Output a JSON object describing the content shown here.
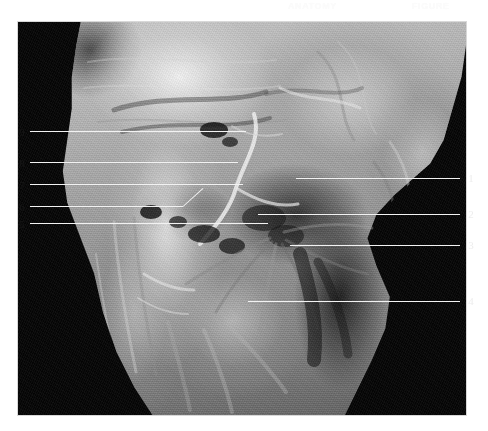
{
  "figure": {
    "kind": "anatomical-dissection-photograph",
    "region_description": "Grayscale dissection plate of the anterior neck / cervical region on a black background",
    "plate": {
      "left": 18,
      "top": 22,
      "width": 448,
      "height": 393,
      "background_color": "#050505"
    },
    "page_background": "#ffffff",
    "leader_line_color": "#f2f2f2",
    "numeral_color_on_white": "#171717",
    "numeral_color_on_black": "#ededed"
  },
  "watermarks": [
    {
      "name": "watermark-left",
      "text": "ANATOMY"
    },
    {
      "name": "watermark-right",
      "text": "FIGURE"
    }
  ],
  "labels": {
    "left": [
      {
        "number": "9",
        "num_x": 18,
        "num_y": 126,
        "line_y": 131,
        "line_x1": 30,
        "line_x2": 246
      },
      {
        "number": "8",
        "num_x": 18,
        "num_y": 157,
        "line_y": 162,
        "line_x1": 30,
        "line_x2": 238
      },
      {
        "number": "7",
        "num_x": 18,
        "num_y": 179,
        "line_y": 184,
        "line_x1": 30,
        "line_x2": 243
      },
      {
        "number": "6",
        "num_x": 18,
        "num_y": 201,
        "line_y": 206,
        "line_x1": 30,
        "line_x2": 183
      },
      {
        "number": "5",
        "num_x": 18,
        "num_y": 218,
        "line_y": 223,
        "line_x1": 30,
        "line_x2": 268
      }
    ],
    "left_diagonal": [
      {
        "for_number": "6",
        "x1": 183,
        "y1": 206,
        "x2": 203,
        "y2": 188
      }
    ],
    "right": [
      {
        "number": "1",
        "num_x": 466,
        "num_y": 173,
        "line_y": 178,
        "line_x1": 296,
        "line_x2": 460
      },
      {
        "number": "2",
        "num_x": 466,
        "num_y": 209,
        "line_y": 214,
        "line_x1": 258,
        "line_x2": 460
      },
      {
        "number": "3",
        "num_x": 466,
        "num_y": 240,
        "line_y": 245,
        "line_x1": 290,
        "line_x2": 460
      },
      {
        "number": "4",
        "num_x": 466,
        "num_y": 296,
        "line_y": 301,
        "line_x1": 248,
        "line_x2": 460
      }
    ]
  }
}
